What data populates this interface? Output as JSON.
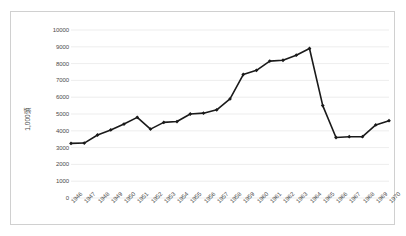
{
  "chart_data": {
    "type": "line",
    "title": "",
    "xlabel": "",
    "ylabel": "1,000頭",
    "ylim": [
      0,
      10000
    ],
    "ytick_step": 1000,
    "yticks": [
      "0",
      "1000",
      "2000",
      "3000",
      "4000",
      "5000",
      "6000",
      "7000",
      "8000",
      "9000",
      "10000"
    ],
    "grid": true,
    "grid_axis": "y",
    "legend": false,
    "legend_position": "none",
    "marker": "diamond",
    "line_color": "#1a1a1a",
    "grid_color": "#e8e8e8",
    "axis_text_color": "#4a4a4a",
    "border_color": "#d0d0d0",
    "background": "#ffffff",
    "categories": [
      "1946",
      "1947",
      "1948",
      "1949",
      "1950",
      "1951",
      "1952",
      "1953",
      "1954",
      "1955",
      "1956",
      "1957",
      "1958",
      "1959",
      "1960",
      "1961",
      "1962",
      "1963",
      "1964",
      "1965",
      "1966",
      "1967",
      "1968",
      "1969",
      "1970"
    ],
    "values": [
      3250,
      3270,
      3750,
      4050,
      4400,
      4800,
      4100,
      4500,
      4550,
      5000,
      5050,
      5250,
      5900,
      7350,
      7600,
      8150,
      8200,
      8500,
      8900,
      5500,
      3600,
      3650,
      3650,
      4350,
      4600
    ]
  }
}
